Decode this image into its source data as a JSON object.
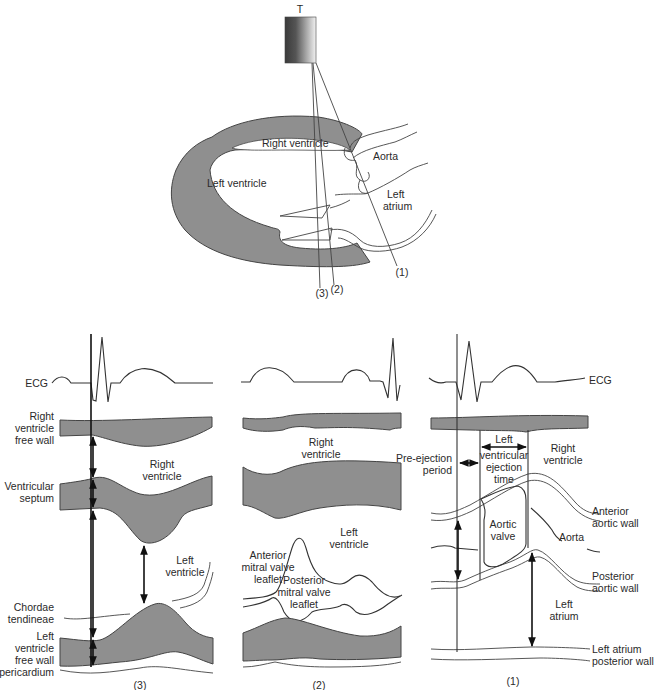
{
  "figure": {
    "transducer": {
      "label": "T"
    },
    "heart": {
      "labels": {
        "right_ventricle": "Right ventricle",
        "left_ventricle": "Left ventricle",
        "aorta": "Aorta",
        "left_atrium_line1": "Left",
        "left_atrium_line2": "atrium"
      },
      "beam_labels": {
        "b1": "(1)",
        "b2": "(2)",
        "b3": "(3)"
      }
    },
    "panel3": {
      "caption": "(3)",
      "left_labels": {
        "ecg": "ECG",
        "rv_free_wall": [
          "Right",
          "ventricle",
          "free wall"
        ],
        "septum": [
          "Ventricular",
          "septum"
        ],
        "chordae": [
          "Chordae",
          "tendineae"
        ],
        "lv_free_wall": [
          "Left",
          "ventricle",
          "free wall"
        ],
        "pericardium": "pericardium"
      },
      "inner_labels": {
        "right_ventricle": [
          "Right",
          "ventricle"
        ],
        "left_ventricle": [
          "Left",
          "ventricle"
        ]
      }
    },
    "panel2": {
      "caption": "(2)",
      "inner_labels": {
        "right_ventricle": [
          "Right",
          "ventricle"
        ],
        "left_ventricle": [
          "Left",
          "ventricle"
        ],
        "anterior_mitral": [
          "Anterior",
          "mitral valve",
          "leaflet"
        ],
        "posterior_mitral": [
          "Posterior",
          "mitral valve",
          "leaflet"
        ]
      }
    },
    "panel1": {
      "caption": "(1)",
      "labels": {
        "ecg": "ECG",
        "pre_ejection": [
          "Pre-ejection",
          "period"
        ],
        "lv_ejection": [
          "Left",
          "ventricular",
          "ejection",
          "time"
        ],
        "right_ventricle": [
          "Right",
          "ventricle"
        ],
        "anterior_aortic_wall": [
          "Anterior",
          "aortic wall"
        ],
        "aortic_valve": [
          "Aortic",
          "valve"
        ],
        "aorta": "Aorta",
        "posterior_aortic_wall": [
          "Posterior",
          "aortic wall"
        ],
        "left_atrium": [
          "Left",
          "atrium"
        ],
        "la_posterior_wall": [
          "Left atrium",
          "posterior wall"
        ]
      }
    }
  }
}
